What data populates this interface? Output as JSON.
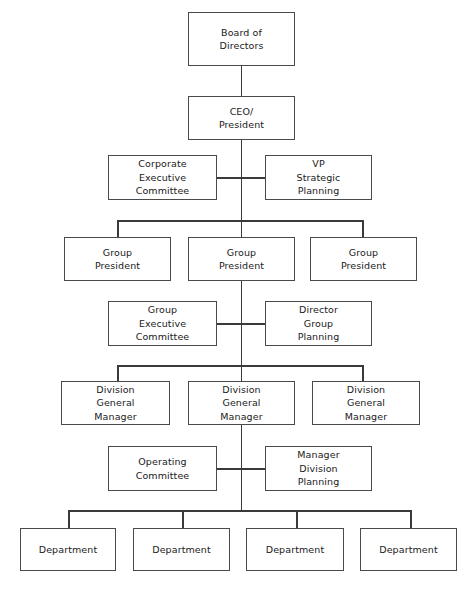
{
  "diagram": {
    "type": "org-chart",
    "background_color": "#ffffff",
    "line_color": "#3a3a3a",
    "box_border_color": "#4a4a4a",
    "text_color": "#1a1a1a",
    "levels": [
      {
        "name": "board",
        "nodes": [
          {
            "id": "board-of-directors",
            "lines": [
              "Board of",
              "Directors"
            ]
          }
        ]
      },
      {
        "name": "executive",
        "nodes": [
          {
            "id": "ceo-president",
            "lines": [
              "CEO/",
              "President"
            ]
          }
        ]
      },
      {
        "name": "corporate-staff",
        "nodes": [
          {
            "id": "corporate-executive-committee",
            "lines": [
              "Corporate",
              "Executive",
              "Committee"
            ]
          },
          {
            "id": "vp-strategic-planning",
            "lines": [
              "VP",
              "Strategic",
              "Planning"
            ]
          }
        ]
      },
      {
        "name": "group-presidents",
        "nodes": [
          {
            "id": "group-president-1",
            "lines": [
              "Group",
              "President"
            ]
          },
          {
            "id": "group-president-2",
            "lines": [
              "Group",
              "President"
            ]
          },
          {
            "id": "group-president-3",
            "lines": [
              "Group",
              "President"
            ]
          }
        ]
      },
      {
        "name": "group-staff",
        "nodes": [
          {
            "id": "group-executive-committee",
            "lines": [
              "Group",
              "Executive",
              "Committee"
            ]
          },
          {
            "id": "director-group-planning",
            "lines": [
              "Director",
              "Group",
              "Planning"
            ]
          }
        ]
      },
      {
        "name": "division-managers",
        "nodes": [
          {
            "id": "division-general-manager-1",
            "lines": [
              "Division",
              "General",
              "Manager"
            ]
          },
          {
            "id": "division-general-manager-2",
            "lines": [
              "Division",
              "General",
              "Manager"
            ]
          },
          {
            "id": "division-general-manager-3",
            "lines": [
              "Division",
              "General",
              "Manager"
            ]
          }
        ]
      },
      {
        "name": "division-staff",
        "nodes": [
          {
            "id": "operating-committee",
            "lines": [
              "Operating",
              "Committee"
            ]
          },
          {
            "id": "manager-division-planning",
            "lines": [
              "Manager",
              "Division",
              "Planning"
            ]
          }
        ]
      },
      {
        "name": "departments",
        "nodes": [
          {
            "id": "department-1",
            "lines": [
              "Department"
            ]
          },
          {
            "id": "department-2",
            "lines": [
              "Department"
            ]
          },
          {
            "id": "department-3",
            "lines": [
              "Department"
            ]
          },
          {
            "id": "department-4",
            "lines": [
              "Department"
            ]
          }
        ]
      }
    ],
    "nodes": {
      "board_of_directors": {
        "line1": "Board of",
        "line2": "Directors"
      },
      "ceo_president": {
        "line1": "CEO/",
        "line2": "President"
      },
      "corporate_executive_committee": {
        "line1": "Corporate",
        "line2": "Executive",
        "line3": "Committee"
      },
      "vp_strategic_planning": {
        "line1": "VP",
        "line2": "Strategic",
        "line3": "Planning"
      },
      "group_president_1": {
        "line1": "Group",
        "line2": "President"
      },
      "group_president_2": {
        "line1": "Group",
        "line2": "President"
      },
      "group_president_3": {
        "line1": "Group",
        "line2": "President"
      },
      "group_executive_committee": {
        "line1": "Group",
        "line2": "Executive",
        "line3": "Committee"
      },
      "director_group_planning": {
        "line1": "Director",
        "line2": "Group",
        "line3": "Planning"
      },
      "division_general_manager_1": {
        "line1": "Division",
        "line2": "General",
        "line3": "Manager"
      },
      "division_general_manager_2": {
        "line1": "Division",
        "line2": "General",
        "line3": "Manager"
      },
      "division_general_manager_3": {
        "line1": "Division",
        "line2": "General",
        "line3": "Manager"
      },
      "operating_committee": {
        "line1": "Operating",
        "line2": "Committee"
      },
      "manager_division_planning": {
        "line1": "Manager",
        "line2": "Division",
        "line3": "Planning"
      },
      "department_1": {
        "line1": "Department"
      },
      "department_2": {
        "line1": "Department"
      },
      "department_3": {
        "line1": "Department"
      },
      "department_4": {
        "line1": "Department"
      }
    }
  }
}
